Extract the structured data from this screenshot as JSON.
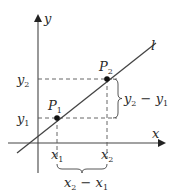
{
  "diagram": {
    "type": "slope-of-line",
    "axes": {
      "x_label": "x",
      "y_label": "y"
    },
    "line": {
      "label": "l"
    },
    "points": [
      {
        "name": "P",
        "sub": "1",
        "x_label": "x",
        "x_sub": "1",
        "y_label": "y",
        "y_sub": "1"
      },
      {
        "name": "P",
        "sub": "2",
        "x_label": "x",
        "x_sub": "2",
        "y_label": "y",
        "y_sub": "2"
      }
    ],
    "rise_label": {
      "a": "y",
      "a_sub": "2",
      "op": " − ",
      "b": "y",
      "b_sub": "1"
    },
    "run_label": {
      "a": "x",
      "a_sub": "2",
      "op": " − ",
      "b": "x",
      "b_sub": "1"
    },
    "colors": {
      "stroke": "#3a3a3a",
      "dash": "#555555",
      "point": "#111111"
    }
  }
}
